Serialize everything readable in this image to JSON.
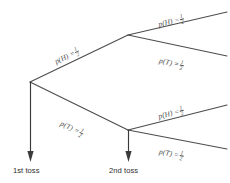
{
  "diagram": {
    "type": "probability-tree",
    "background_color": "#ffffff",
    "line_color": "#4d4d4d",
    "text_color": "#4a4a4a"
  },
  "branches": {
    "first_heads": {
      "label_prefix": "p(H) =",
      "numerator": "1",
      "denominator": "2",
      "outcome": "H",
      "probability": "1/2"
    },
    "first_tails": {
      "label_prefix": "p(T) =",
      "numerator": "1",
      "denominator": "2",
      "outcome": "T",
      "probability": "1/2"
    },
    "second_heads_upper": {
      "label_prefix": "p(H) =",
      "numerator": "1",
      "denominator": "2",
      "outcome": "H",
      "probability": "1/2"
    },
    "second_tails_upper": {
      "label_prefix": "p(T) =",
      "numerator": "1",
      "denominator": "2",
      "outcome": "T",
      "probability": "1/2"
    },
    "second_heads_lower": {
      "label_prefix": "p(H) =",
      "numerator": "1",
      "denominator": "2",
      "outcome": "H",
      "probability": "1/2"
    },
    "second_tails_lower": {
      "label_prefix": "p(T) =",
      "numerator": "1",
      "denominator": "2",
      "outcome": "T",
      "probability": "1/2"
    }
  },
  "captions": {
    "first_toss": "1st toss",
    "second_toss": "2nd toss"
  }
}
